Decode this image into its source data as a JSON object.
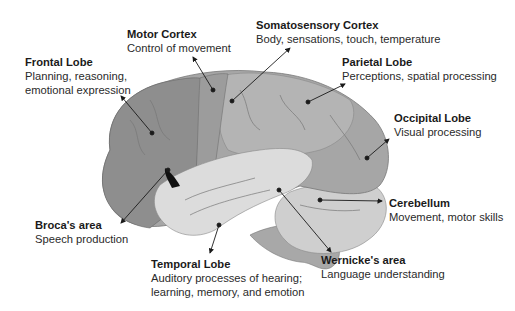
{
  "diagram": {
    "labels": [
      {
        "id": "frontal",
        "title": "Frontal Lobe",
        "desc": [
          "Planning, reasoning,",
          "emotional expression"
        ],
        "x": 25,
        "y": 55
      },
      {
        "id": "motor",
        "title": "Motor Cortex",
        "desc": [
          "Control of movement"
        ],
        "x": 127,
        "y": 27
      },
      {
        "id": "somatosensory",
        "title": "Somatosensory Cortex",
        "desc": [
          "Body, sensations, touch, temperature"
        ],
        "x": 256,
        "y": 18
      },
      {
        "id": "parietal",
        "title": "Parietal Lobe",
        "desc": [
          "Perceptions, spatial processing"
        ],
        "x": 342,
        "y": 55
      },
      {
        "id": "occipital",
        "title": "Occipital Lobe",
        "desc": [
          "Visual processing"
        ],
        "x": 394,
        "y": 111
      },
      {
        "id": "cerebellum",
        "title": "Cerebellum",
        "desc": [
          "Movement, motor skills"
        ],
        "x": 389,
        "y": 196
      },
      {
        "id": "wernicke",
        "title": "Wernicke's area",
        "desc": [
          "Language understanding"
        ],
        "x": 321,
        "y": 253
      },
      {
        "id": "temporal",
        "title": "Temporal Lobe",
        "desc": [
          "Auditory processes of hearing;",
          "learning, memory, and emotion"
        ],
        "x": 151,
        "y": 257
      },
      {
        "id": "broca",
        "title": "Broca's area",
        "desc": [
          "Speech production"
        ],
        "x": 35,
        "y": 218
      }
    ],
    "colors": {
      "frontal": "#8e8e8e",
      "motor": "#9c9c9c",
      "parietal": "#b4b4b4",
      "occipital": "#a6a6a6",
      "temporal": "#dcdcdc",
      "cerebellum": "#cfcfcf",
      "brainstem": "#a8a8a8",
      "line": "#1a1a1a"
    }
  }
}
